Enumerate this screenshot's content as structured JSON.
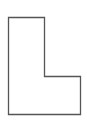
{
  "diagram": {
    "shape": "L-shape",
    "stroke_color": "#555555",
    "fill_color": "#ffffff",
    "points": "8.5,17.5 44.5,17.5 44.5,76.5 80.5,76.5 80.5,114.5 8.5,114.5"
  }
}
